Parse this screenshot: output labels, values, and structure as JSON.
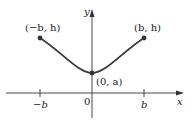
{
  "diagram": {
    "axes": {
      "x_label": "x",
      "y_label": "y",
      "origin_label": "0"
    },
    "x_ticks": [
      "−b",
      "b"
    ],
    "points": {
      "left": "(−b, h)",
      "right": "(b, h)",
      "vertex": "(0, a)"
    },
    "colors": {
      "curve": "#3a3a3a",
      "axis": "#333333"
    }
  }
}
